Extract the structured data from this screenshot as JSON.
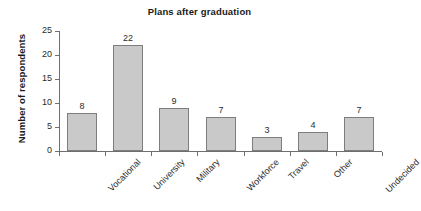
{
  "chart_data": {
    "type": "bar",
    "title": "Plans after graduation",
    "xlabel": "",
    "ylabel": "Number of respondents",
    "categories": [
      "Vocational",
      "University",
      "Military",
      "Workforce",
      "Travel",
      "Other",
      "Undecided"
    ],
    "values": [
      8,
      22,
      9,
      7,
      3,
      4,
      7
    ],
    "value_labels": [
      "8",
      "22",
      "9",
      "7",
      "3",
      "4",
      "7"
    ],
    "ylim": [
      0,
      25
    ],
    "ytick_values": [
      0,
      5,
      10,
      15,
      20,
      25
    ],
    "ytick_labels": [
      "0",
      "5",
      "10",
      "15",
      "20",
      "25"
    ],
    "grid": false,
    "legend": false,
    "legend_position": "none",
    "bar_fill_color": "#c9c9c9",
    "bar_border_color": "#7d7d7d",
    "axis_color": "#6e6e6e",
    "background_color": "#ffffff",
    "text_color": "#1a1a1a",
    "xtick_label_rotation": 45
  }
}
